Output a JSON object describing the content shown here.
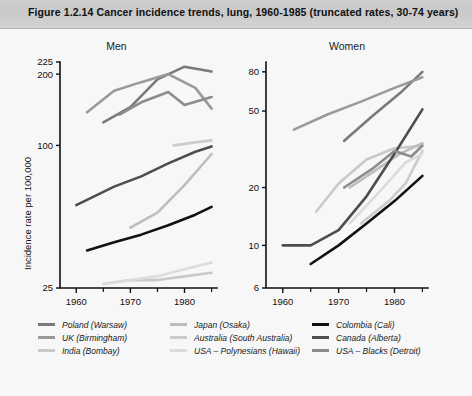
{
  "figure": {
    "title": "Figure 1.2.14  Cancer incidence trends, lung, 1960-1985 (truncated rates, 30-74 years)",
    "background": "#f7f7f7",
    "title_band_color": "#cdcdcd"
  },
  "axis": {
    "ylabel": "Incidence rate per 100,000"
  },
  "panels": {
    "men": {
      "title": "Men"
    },
    "women": {
      "title": "Women"
    }
  },
  "legend": {
    "columns": [
      {
        "entries": [
          {
            "label": "Poland (Warsaw)",
            "color": "#7a7a7a"
          },
          {
            "label": "UK (Birmingham)",
            "color": "#9a9a9a"
          },
          {
            "label": "India (Bombay)",
            "color": "#c9c9c9"
          }
        ]
      },
      {
        "entries": [
          {
            "label": "Japan (Osaka)",
            "color": "#bdbdbd"
          },
          {
            "label": "Australia (South Australia)",
            "color": "#cccccc"
          },
          {
            "label": "USA – Polynesians (Hawaii)",
            "color": "#dcdcdc"
          }
        ]
      },
      {
        "entries": [
          {
            "label": "Colombia (Cali)",
            "color": "#111111"
          },
          {
            "label": "Canada (Alberta)",
            "color": "#4d4d4d"
          },
          {
            "label": "USA – Blacks (Detroit)",
            "color": "#8c8c8c"
          }
        ]
      }
    ]
  },
  "chart_data": [
    {
      "type": "line",
      "title": "Men",
      "xlabel": "",
      "ylabel": "Incidence rate per 100,000",
      "yscale": "log",
      "ylim": [
        25,
        225
      ],
      "yticks": [
        25,
        100,
        200,
        225
      ],
      "ytick_labels": [
        "25",
        "100",
        "200",
        "225"
      ],
      "xlim": [
        1957,
        1986
      ],
      "xticks": [
        1960,
        1970,
        1980
      ],
      "xtick_labels": [
        "1960",
        "1970",
        "1980"
      ],
      "xminor_ticks": [
        1965,
        1975,
        1985
      ],
      "grid": false,
      "legend_position": "below",
      "series": [
        {
          "name": "Poland (Warsaw)",
          "color": "#7a7a7a",
          "x": [
            1965,
            1970,
            1975,
            1980,
            1985
          ],
          "y": [
            125,
            145,
            190,
            215,
            205
          ]
        },
        {
          "name": "UK (Birmingham)",
          "color": "#9a9a9a",
          "x": [
            1962,
            1967,
            1972,
            1977,
            1982,
            1985
          ],
          "y": [
            138,
            170,
            185,
            200,
            175,
            143
          ]
        },
        {
          "name": "India (Bombay)",
          "color": "#c9c9c9",
          "x": [
            1965,
            1970,
            1975,
            1980,
            1985
          ],
          "y": [
            26,
            27,
            27,
            28,
            29
          ]
        },
        {
          "name": "Japan (Osaka)",
          "color": "#bdbdbd",
          "x": [
            1970,
            1975,
            1980,
            1985
          ],
          "y": [
            45,
            52,
            68,
            92
          ]
        },
        {
          "name": "Australia (South Australia)",
          "color": "#cccccc",
          "x": [
            1978,
            1982,
            1985
          ],
          "y": [
            100,
            103,
            105
          ]
        },
        {
          "name": "USA – Polynesians (Hawaii)",
          "color": "#dcdcdc",
          "x": [
            1965,
            1970,
            1975,
            1980,
            1985
          ],
          "y": [
            26,
            27,
            28,
            30,
            32
          ]
        },
        {
          "name": "Colombia (Cali)",
          "color": "#111111",
          "x": [
            1962,
            1967,
            1972,
            1977,
            1982,
            1985
          ],
          "y": [
            36,
            39,
            42,
            46,
            51,
            55
          ]
        },
        {
          "name": "Canada (Alberta)",
          "color": "#4d4d4d",
          "x": [
            1960,
            1967,
            1972,
            1977,
            1982,
            1985
          ],
          "y": [
            56,
            67,
            74,
            84,
            94,
            99
          ]
        },
        {
          "name": "USA – Blacks (Detroit)",
          "color": "#8c8c8c",
          "x": [
            1968,
            1972,
            1977,
            1980,
            1985
          ],
          "y": [
            135,
            152,
            168,
            148,
            160
          ]
        }
      ]
    },
    {
      "type": "line",
      "title": "Women",
      "xlabel": "",
      "ylabel": "",
      "yscale": "log",
      "ylim": [
        6,
        90
      ],
      "yticks": [
        6,
        10,
        20,
        50,
        80
      ],
      "ytick_labels": [
        "6",
        "10",
        "20",
        "50",
        "80"
      ],
      "xlim": [
        1957,
        1986
      ],
      "xticks": [
        1960,
        1970,
        1980
      ],
      "xtick_labels": [
        "1960",
        "1970",
        "1980"
      ],
      "xminor_ticks": [
        1965,
        1975,
        1985
      ],
      "grid": false,
      "legend_position": "below",
      "series": [
        {
          "name": "Poland (Warsaw)",
          "color": "#7a7a7a",
          "x": [
            1971,
            1976,
            1981,
            1985
          ],
          "y": [
            35,
            47,
            62,
            80
          ]
        },
        {
          "name": "UK (Birmingham)",
          "color": "#9a9a9a",
          "x": [
            1962,
            1968,
            1974,
            1980,
            1985
          ],
          "y": [
            40,
            48,
            56,
            66,
            75
          ]
        },
        {
          "name": "India (Bombay)",
          "color": "#c9c9c9",
          "x": [
            1966,
            1970,
            1975,
            1980,
            1985
          ],
          "y": [
            15,
            21,
            28,
            32,
            33
          ]
        },
        {
          "name": "Japan (Osaka)",
          "color": "#bdbdbd",
          "x": [
            1972,
            1977,
            1981,
            1985
          ],
          "y": [
            20,
            25,
            30,
            34
          ]
        },
        {
          "name": "Australia (South Australia)",
          "color": "#cccccc",
          "x": [
            1974,
            1979,
            1982,
            1985
          ],
          "y": [
            13,
            17,
            21,
            31
          ]
        },
        {
          "name": "USA – Polynesians (Hawaii)",
          "color": "#dcdcdc",
          "x": [
            1972,
            1978,
            1982,
            1985
          ],
          "y": [
            13,
            20,
            27,
            30
          ]
        },
        {
          "name": "Colombia (Cali)",
          "color": "#111111",
          "x": [
            1965,
            1970,
            1975,
            1980,
            1985
          ],
          "y": [
            8,
            10,
            13,
            17,
            23
          ]
        },
        {
          "name": "Canada (Alberta)",
          "color": "#4d4d4d",
          "x": [
            1960,
            1965,
            1970,
            1975,
            1980,
            1985
          ],
          "y": [
            10,
            10,
            12,
            18,
            30,
            51
          ]
        },
        {
          "name": "USA – Blacks (Detroit)",
          "color": "#8c8c8c",
          "x": [
            1971,
            1976,
            1980,
            1983,
            1985
          ],
          "y": [
            20,
            25,
            31,
            29,
            33
          ]
        }
      ]
    }
  ]
}
